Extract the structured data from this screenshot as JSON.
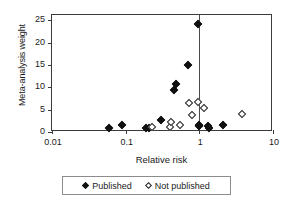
{
  "chart_data": {
    "type": "scatter",
    "title": "",
    "xlabel": "Relative risk",
    "ylabel": "Meta-analysis weight",
    "xscale": "log",
    "xlim": [
      0.01,
      10
    ],
    "ylim": [
      0,
      26.2
    ],
    "xticks": [
      0.01,
      0.1,
      1,
      10
    ],
    "xtick_labels": [
      "0.01",
      "0.1",
      "1",
      "10"
    ],
    "yticks": [
      0,
      5,
      10,
      15,
      20,
      25
    ],
    "ytick_labels": [
      "0",
      "5",
      "10",
      "15",
      "20",
      "25"
    ],
    "grid": false,
    "legend_position": "below",
    "reference_line": {
      "orientation": "vertical",
      "x": 1,
      "color": "#4a4a4a"
    },
    "series": [
      {
        "name": "Published",
        "marker": "filled-diamond",
        "color": "#111111",
        "points": [
          {
            "x": 0.06,
            "y": 0.9
          },
          {
            "x": 0.09,
            "y": 1.6
          },
          {
            "x": 0.19,
            "y": 0.9
          },
          {
            "x": 0.205,
            "y": 1.0
          },
          {
            "x": 0.3,
            "y": 2.7
          },
          {
            "x": 0.45,
            "y": 9.3
          },
          {
            "x": 0.48,
            "y": 10.8
          },
          {
            "x": 0.7,
            "y": 14.9
          },
          {
            "x": 0.95,
            "y": 24.1
          },
          {
            "x": 0.98,
            "y": 1.3
          },
          {
            "x": 1.0,
            "y": 1.5
          },
          {
            "x": 1.3,
            "y": 1.4
          },
          {
            "x": 1.35,
            "y": 0.9
          },
          {
            "x": 2.1,
            "y": 1.5
          }
        ]
      },
      {
        "name": "Not published",
        "marker": "open-diamond",
        "color": "#232323",
        "points": [
          {
            "x": 0.23,
            "y": 1.1
          },
          {
            "x": 0.4,
            "y": 1.2
          },
          {
            "x": 0.41,
            "y": 2.3
          },
          {
            "x": 0.55,
            "y": 1.5
          },
          {
            "x": 0.72,
            "y": 6.5
          },
          {
            "x": 0.8,
            "y": 3.9
          },
          {
            "x": 0.96,
            "y": 6.7
          },
          {
            "x": 1.15,
            "y": 5.4
          },
          {
            "x": 3.8,
            "y": 4.0
          }
        ]
      }
    ]
  },
  "legend": {
    "entries": [
      {
        "label": "Published",
        "marker": "filled-diamond"
      },
      {
        "label": "Not published",
        "marker": "open-diamond"
      }
    ]
  }
}
